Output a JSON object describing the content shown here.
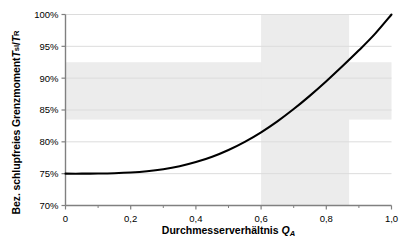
{
  "chart_data": {
    "type": "line",
    "title": "",
    "xlabel": "Durchmesserverhältnis Q_A",
    "ylabel": "Bez. schlupfreies Grenzmoment T_sl / T_R",
    "xlim": [
      0,
      1.0
    ],
    "ylim": [
      0.7,
      1.0
    ],
    "grid": true,
    "legend": "none",
    "x_ticks": [
      0,
      0.2,
      0.4,
      0.6,
      0.8,
      1.0
    ],
    "x_tick_labels": [
      "0",
      "0,2",
      "0,4",
      "0,6",
      "0,8",
      "1,0"
    ],
    "y_ticks": [
      0.7,
      0.75,
      0.8,
      0.85,
      0.9,
      0.95,
      1.0
    ],
    "y_tick_labels": [
      "70%",
      "75%",
      "80%",
      "85%",
      "90%",
      "95%",
      "100%"
    ],
    "series": [
      {
        "name": "Bez. schlupfreies Grenzmoment",
        "color": "#000000",
        "x": [
          0.0,
          0.05,
          0.1,
          0.15,
          0.2,
          0.25,
          0.3,
          0.35,
          0.4,
          0.45,
          0.5,
          0.55,
          0.6,
          0.65,
          0.7,
          0.75,
          0.8,
          0.85,
          0.9,
          0.95,
          1.0
        ],
        "y": [
          0.75,
          0.75,
          0.7502,
          0.7507,
          0.7518,
          0.7538,
          0.757,
          0.7617,
          0.7682,
          0.7766,
          0.7872,
          0.8,
          0.815,
          0.8322,
          0.8515,
          0.8726,
          0.8952,
          0.919,
          0.9437,
          0.97,
          1.0
        ]
      }
    ],
    "shaded_regions": [
      {
        "name": "horizontal-band",
        "orientation": "horizontal",
        "y_from": 0.835,
        "y_to": 0.925,
        "color": "#ececec"
      },
      {
        "name": "vertical-band",
        "orientation": "vertical",
        "x_from": 0.6,
        "x_to": 0.87,
        "color": "#ececec"
      }
    ]
  },
  "axes": {
    "y_title_prefix": "Bez. schlupfreies Grenzmoment ",
    "y_title_sym1": "T",
    "y_title_sub1": "sl",
    "y_title_sep": " / ",
    "y_title_sym2": "T",
    "y_title_sub2": "R",
    "x_title_text": "Durchmesserverhältnis ",
    "x_title_sym": "Q",
    "x_title_sub": "A"
  },
  "colors": {
    "curve": "#000000",
    "axis": "#808080",
    "grid": "#dcdcdc",
    "band": "#ececec",
    "background": "#ffffff"
  }
}
